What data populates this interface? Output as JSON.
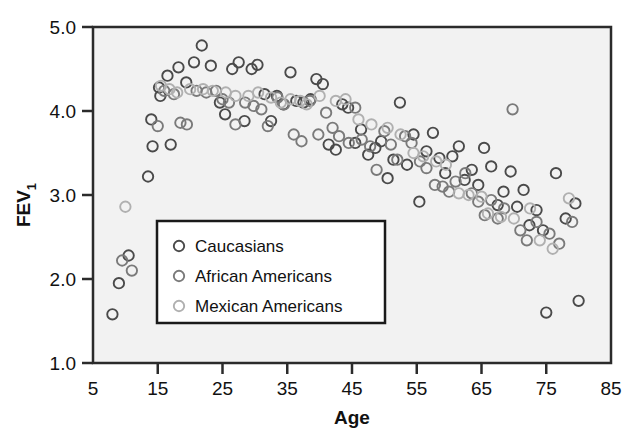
{
  "chart_data": {
    "type": "scatter",
    "title": "",
    "xlabel": "Age",
    "ylabel": "FEV1",
    "ylabel_display": "FEV",
    "ylabel_subscript": "1",
    "xlim": [
      5,
      85
    ],
    "ylim": [
      1.0,
      5.0
    ],
    "xticks": [
      5,
      15,
      25,
      35,
      45,
      55,
      65,
      75,
      85
    ],
    "xtick_labels": [
      "5",
      "15",
      "25",
      "35",
      "45",
      "55",
      "65",
      "75",
      "85"
    ],
    "yticks": [
      1.0,
      2.0,
      3.0,
      4.0,
      5.0
    ],
    "ytick_labels": [
      "1.0",
      "2.0",
      "3.0",
      "4.0",
      "5.0"
    ],
    "grid": false,
    "legend_position": "lower-left-inside",
    "marker": "open-circle",
    "plot_background": "#f2f2f2",
    "frame_color": "#2b2b2b",
    "series": [
      {
        "name": "Caucasians",
        "color": "#4a4a4a",
        "points": [
          [
            8.0,
            1.58
          ],
          [
            9.0,
            1.95
          ],
          [
            10.5,
            2.28
          ],
          [
            13.5,
            3.22
          ],
          [
            14.2,
            3.58
          ],
          [
            14.0,
            3.9
          ],
          [
            15.2,
            4.28
          ],
          [
            15.4,
            4.18
          ],
          [
            16.5,
            4.42
          ],
          [
            17.0,
            3.6
          ],
          [
            18.2,
            4.52
          ],
          [
            19.4,
            4.34
          ],
          [
            20.6,
            4.58
          ],
          [
            21.8,
            4.78
          ],
          [
            23.2,
            4.54
          ],
          [
            24.6,
            4.1
          ],
          [
            25.4,
            3.96
          ],
          [
            26.5,
            4.5
          ],
          [
            27.5,
            4.58
          ],
          [
            28.4,
            3.88
          ],
          [
            29.5,
            4.5
          ],
          [
            30.4,
            4.55
          ],
          [
            31.5,
            4.2
          ],
          [
            32.5,
            3.88
          ],
          [
            33.4,
            4.18
          ],
          [
            34.4,
            4.08
          ],
          [
            35.5,
            4.46
          ],
          [
            36.4,
            4.12
          ],
          [
            37.5,
            4.1
          ],
          [
            38.6,
            4.14
          ],
          [
            39.5,
            4.38
          ],
          [
            40.5,
            4.32
          ],
          [
            41.4,
            3.6
          ],
          [
            42.5,
            3.54
          ],
          [
            43.5,
            4.08
          ],
          [
            44.4,
            4.04
          ],
          [
            45.5,
            3.62
          ],
          [
            46.4,
            3.78
          ],
          [
            47.5,
            3.48
          ],
          [
            48.6,
            3.56
          ],
          [
            49.5,
            3.64
          ],
          [
            50.5,
            3.2
          ],
          [
            51.4,
            3.42
          ],
          [
            52.4,
            4.1
          ],
          [
            53.5,
            3.36
          ],
          [
            54.5,
            3.72
          ],
          [
            55.4,
            2.92
          ],
          [
            56.5,
            3.52
          ],
          [
            57.5,
            3.74
          ],
          [
            58.5,
            3.44
          ],
          [
            59.4,
            3.26
          ],
          [
            60.5,
            3.46
          ],
          [
            61.5,
            3.58
          ],
          [
            62.4,
            3.18
          ],
          [
            63.5,
            3.3
          ],
          [
            64.5,
            3.12
          ],
          [
            65.4,
            3.56
          ],
          [
            66.5,
            3.34
          ],
          [
            67.5,
            2.88
          ],
          [
            68.4,
            3.04
          ],
          [
            69.5,
            3.28
          ],
          [
            70.5,
            2.86
          ],
          [
            71.5,
            3.06
          ],
          [
            72.4,
            2.64
          ],
          [
            73.5,
            2.82
          ],
          [
            74.5,
            2.58
          ],
          [
            75.0,
            1.6
          ],
          [
            76.5,
            3.26
          ],
          [
            78.0,
            2.72
          ],
          [
            79.5,
            2.9
          ],
          [
            80.0,
            1.74
          ]
        ]
      },
      {
        "name": "African Americans",
        "color": "#7a7a7a",
        "points": [
          [
            9.5,
            2.22
          ],
          [
            11.0,
            2.1
          ],
          [
            15.0,
            3.82
          ],
          [
            16.0,
            4.24
          ],
          [
            17.5,
            4.2
          ],
          [
            18.5,
            3.86
          ],
          [
            19.5,
            3.84
          ],
          [
            21.0,
            4.24
          ],
          [
            22.5,
            4.22
          ],
          [
            24.0,
            4.24
          ],
          [
            25.0,
            4.14
          ],
          [
            26.0,
            4.1
          ],
          [
            27.0,
            3.84
          ],
          [
            28.5,
            4.1
          ],
          [
            29.8,
            4.06
          ],
          [
            31.0,
            4.02
          ],
          [
            32.0,
            3.82
          ],
          [
            33.5,
            4.16
          ],
          [
            34.5,
            4.08
          ],
          [
            36.0,
            3.72
          ],
          [
            37.2,
            3.64
          ],
          [
            38.5,
            4.12
          ],
          [
            39.8,
            3.72
          ],
          [
            41.0,
            3.98
          ],
          [
            42.0,
            3.8
          ],
          [
            43.0,
            3.7
          ],
          [
            44.5,
            3.62
          ],
          [
            45.5,
            4.04
          ],
          [
            46.5,
            3.66
          ],
          [
            47.8,
            3.58
          ],
          [
            48.8,
            3.3
          ],
          [
            50.0,
            3.76
          ],
          [
            51.0,
            3.6
          ],
          [
            52.0,
            3.42
          ],
          [
            53.2,
            3.7
          ],
          [
            54.2,
            3.62
          ],
          [
            55.5,
            3.4
          ],
          [
            56.5,
            3.32
          ],
          [
            57.8,
            3.12
          ],
          [
            59.0,
            3.1
          ],
          [
            60.0,
            3.04
          ],
          [
            61.0,
            3.16
          ],
          [
            62.5,
            3.26
          ],
          [
            63.5,
            3.02
          ],
          [
            64.5,
            2.92
          ],
          [
            65.5,
            2.76
          ],
          [
            66.5,
            2.94
          ],
          [
            67.5,
            2.72
          ],
          [
            68.5,
            2.84
          ],
          [
            69.8,
            4.02
          ],
          [
            71.0,
            2.58
          ],
          [
            72.0,
            2.46
          ],
          [
            73.5,
            2.68
          ],
          [
            75.5,
            2.54
          ],
          [
            77.0,
            2.42
          ],
          [
            79.0,
            2.68
          ]
        ]
      },
      {
        "name": "Mexican Americans",
        "color": "#b0b0b0",
        "points": [
          [
            10.0,
            2.86
          ],
          [
            15.5,
            4.3
          ],
          [
            16.8,
            4.26
          ],
          [
            18.0,
            4.22
          ],
          [
            20.0,
            4.26
          ],
          [
            22.0,
            4.26
          ],
          [
            23.5,
            4.24
          ],
          [
            25.5,
            4.22
          ],
          [
            27.0,
            4.18
          ],
          [
            29.0,
            4.18
          ],
          [
            30.5,
            4.22
          ],
          [
            32.5,
            4.16
          ],
          [
            34.0,
            4.1
          ],
          [
            35.5,
            4.14
          ],
          [
            37.0,
            4.12
          ],
          [
            38.0,
            4.08
          ],
          [
            40.0,
            4.18
          ],
          [
            42.5,
            4.12
          ],
          [
            44.0,
            4.14
          ],
          [
            46.0,
            3.9
          ],
          [
            48.0,
            3.84
          ],
          [
            50.5,
            3.8
          ],
          [
            52.5,
            3.72
          ],
          [
            54.5,
            3.5
          ],
          [
            56.0,
            3.46
          ],
          [
            58.0,
            3.4
          ],
          [
            59.5,
            3.36
          ],
          [
            61.5,
            3.02
          ],
          [
            63.0,
            3.0
          ],
          [
            65.0,
            2.98
          ],
          [
            66.0,
            2.78
          ],
          [
            68.0,
            2.74
          ],
          [
            70.0,
            2.72
          ],
          [
            72.5,
            2.84
          ],
          [
            74.0,
            2.46
          ],
          [
            76.0,
            2.36
          ],
          [
            78.5,
            2.96
          ]
        ]
      }
    ]
  },
  "legend": {
    "items": [
      {
        "label": "Caucasians",
        "color": "#4a4a4a"
      },
      {
        "label": "African Americans",
        "color": "#7a7a7a"
      },
      {
        "label": "Mexican Americans",
        "color": "#b0b0b0"
      }
    ]
  }
}
